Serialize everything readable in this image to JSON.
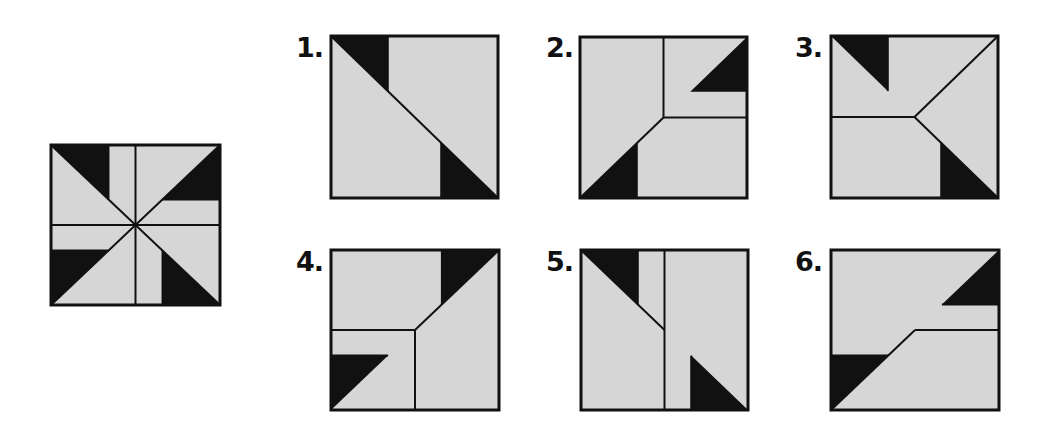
{
  "puzzle": {
    "colors": {
      "fill": "#d6d6d6",
      "black": "#111111",
      "stroke": "#111111",
      "background": "#ffffff"
    },
    "target": {
      "name": "pinwheel-square",
      "box": {
        "x": 51,
        "y": 145,
        "w": 169,
        "h": 160
      },
      "lines": [
        [
          0,
          0,
          100,
          100
        ],
        [
          100,
          0,
          0,
          100
        ],
        [
          50,
          0,
          50,
          100
        ],
        [
          0,
          50,
          100,
          50
        ],
        [
          34,
          0,
          34,
          34
        ],
        [
          66,
          34,
          100,
          34
        ],
        [
          0,
          66,
          34,
          66
        ],
        [
          66,
          66,
          66,
          100
        ]
      ],
      "black": [
        [
          [
            0,
            0
          ],
          [
            34,
            0
          ],
          [
            34,
            34
          ]
        ],
        [
          [
            100,
            0
          ],
          [
            66,
            34
          ],
          [
            100,
            34
          ]
        ],
        [
          [
            0,
            66
          ],
          [
            34,
            66
          ],
          [
            0,
            100
          ]
        ],
        [
          [
            66,
            66
          ],
          [
            66,
            100
          ],
          [
            100,
            100
          ]
        ]
      ]
    },
    "options": [
      {
        "label": "1.",
        "label_pos": {
          "x": 296,
          "y": 36
        },
        "box": {
          "x": 331,
          "y": 36,
          "w": 167,
          "h": 162
        },
        "lines": [
          [
            0,
            0,
            100,
            100
          ],
          [
            34,
            0,
            34,
            34
          ],
          [
            66,
            66,
            66,
            100
          ]
        ],
        "black": [
          [
            [
              0,
              0
            ],
            [
              34,
              0
            ],
            [
              34,
              34
            ]
          ],
          [
            [
              66,
              66
            ],
            [
              66,
              100
            ],
            [
              100,
              100
            ]
          ]
        ]
      },
      {
        "label": "2.",
        "label_pos": {
          "x": 546,
          "y": 36
        },
        "box": {
          "x": 580,
          "y": 37,
          "w": 167,
          "h": 161
        },
        "lines": [
          [
            50,
            0,
            50,
            50
          ],
          [
            50,
            50,
            100,
            50
          ],
          [
            50,
            50,
            0,
            100
          ],
          [
            34,
            66,
            34,
            100
          ]
        ],
        "black": [
          [
            [
              100,
              0
            ],
            [
              66,
              34
            ],
            [
              100,
              34
            ]
          ],
          [
            [
              0,
              100
            ],
            [
              34,
              66
            ],
            [
              34,
              100
            ]
          ]
        ]
      },
      {
        "label": "3.",
        "label_pos": {
          "x": 795,
          "y": 36
        },
        "box": {
          "x": 831,
          "y": 36,
          "w": 167,
          "h": 162
        },
        "lines": [
          [
            0,
            50,
            50,
            50
          ],
          [
            50,
            50,
            100,
            0
          ],
          [
            50,
            50,
            100,
            100
          ],
          [
            34,
            0,
            34,
            34
          ],
          [
            66,
            66,
            66,
            100
          ]
        ],
        "black": [
          [
            [
              0,
              0
            ],
            [
              34,
              0
            ],
            [
              34,
              34
            ]
          ],
          [
            [
              66,
              66
            ],
            [
              66,
              100
            ],
            [
              100,
              100
            ]
          ]
        ]
      },
      {
        "label": "4.",
        "label_pos": {
          "x": 296,
          "y": 250
        },
        "box": {
          "x": 331,
          "y": 250,
          "w": 168,
          "h": 160
        },
        "lines": [
          [
            50,
            50,
            100,
            0
          ],
          [
            0,
            50,
            50,
            50
          ],
          [
            50,
            50,
            50,
            100
          ],
          [
            66,
            0,
            66,
            34
          ],
          [
            0,
            66,
            34,
            66
          ]
        ],
        "black": [
          [
            [
              66,
              0
            ],
            [
              100,
              0
            ],
            [
              66,
              34
            ]
          ],
          [
            [
              0,
              66
            ],
            [
              34,
              66
            ],
            [
              0,
              100
            ]
          ]
        ]
      },
      {
        "label": "5.",
        "label_pos": {
          "x": 546,
          "y": 250
        },
        "box": {
          "x": 581,
          "y": 250,
          "w": 167,
          "h": 160
        },
        "lines": [
          [
            50,
            0,
            50,
            100
          ],
          [
            0,
            0,
            50,
            50
          ],
          [
            34,
            0,
            34,
            34
          ],
          [
            66,
            66,
            66,
            100
          ]
        ],
        "black": [
          [
            [
              0,
              0
            ],
            [
              34,
              0
            ],
            [
              34,
              34
            ]
          ],
          [
            [
              66,
              66
            ],
            [
              66,
              100
            ],
            [
              100,
              100
            ]
          ]
        ]
      },
      {
        "label": "6.",
        "label_pos": {
          "x": 795,
          "y": 250
        },
        "box": {
          "x": 831,
          "y": 250,
          "w": 168,
          "h": 160
        },
        "lines": [
          [
            50,
            50,
            100,
            50
          ],
          [
            50,
            50,
            0,
            100
          ],
          [
            66,
            34,
            100,
            34
          ],
          [
            0,
            66,
            34,
            66
          ]
        ],
        "black": [
          [
            [
              100,
              0
            ],
            [
              66,
              34
            ],
            [
              100,
              34
            ]
          ],
          [
            [
              0,
              66
            ],
            [
              34,
              66
            ],
            [
              0,
              100
            ]
          ]
        ]
      }
    ]
  }
}
